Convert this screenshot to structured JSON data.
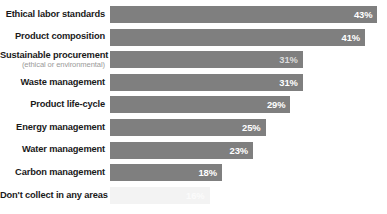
{
  "chart_data": {
    "type": "bar",
    "orientation": "horizontal",
    "title": "",
    "subtitle": "",
    "xlabel": "",
    "ylabel": "",
    "xlim": [
      0,
      48
    ],
    "grid": false,
    "legend": null,
    "value_suffix": "%",
    "categories": [
      "Ethical labor standards",
      "Product composition",
      "Sustainable procurement",
      "Waste management",
      "Product life-cycle",
      "Energy management",
      "Water management",
      "Carbon management",
      "Don't collect in any areas"
    ],
    "values": [
      43,
      41,
      31,
      31,
      29,
      25,
      23,
      18,
      16
    ],
    "value_labels": [
      "43%",
      "41%",
      "31%",
      "31%",
      "29%",
      "25%",
      "23%",
      "18%",
      "16%"
    ],
    "bars": [
      {
        "label": "Ethical labor standards",
        "sublabel": "",
        "value": 43,
        "value_label": "43%",
        "style": "solid"
      },
      {
        "label": "Product composition",
        "sublabel": "",
        "value": 41,
        "value_label": "41%",
        "style": "solid"
      },
      {
        "label": "Sustainable procurement",
        "sublabel": "(ethical or environmental)",
        "value": 31,
        "value_label": "31%",
        "style": "semi"
      },
      {
        "label": "Waste management",
        "sublabel": "",
        "value": 31,
        "value_label": "31%",
        "style": "solid"
      },
      {
        "label": "Product life-cycle",
        "sublabel": "",
        "value": 29,
        "value_label": "29%",
        "style": "solid"
      },
      {
        "label": "Energy management",
        "sublabel": "",
        "value": 25,
        "value_label": "25%",
        "style": "solid"
      },
      {
        "label": "Water management",
        "sublabel": "",
        "value": 23,
        "value_label": "23%",
        "style": "solid"
      },
      {
        "label": "Carbon management",
        "sublabel": "",
        "value": 18,
        "value_label": "18%",
        "style": "solid"
      },
      {
        "label": "Don't collect in any areas",
        "sublabel": "",
        "value": 16,
        "value_label": "16%",
        "style": "faint"
      }
    ]
  },
  "colors": {
    "bar_fill": "#7f7f7f",
    "bar_fill_faint": "#f3f3f3",
    "value_text": "#ffffff",
    "value_text_faint": "#fbfbfb",
    "label_text": "#1a1a1a",
    "sublabel_text": "#9a9a9a",
    "background": "#ffffff"
  },
  "layout": {
    "label_column_width": 110,
    "bar_start_x": 110,
    "bar_height": 17,
    "row_pitch": 22.6,
    "first_row_top": 6,
    "px_per_unit": 6.22
  }
}
